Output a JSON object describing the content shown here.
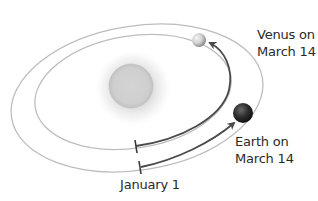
{
  "diagram": {
    "title": "",
    "labels": {
      "venus": {
        "line1": "Venus on",
        "line2": "March 14"
      },
      "earth": {
        "line1": "Earth on",
        "line2": "March 14"
      },
      "start": "January 1"
    },
    "bodies": [
      {
        "name": "Sun",
        "color": "#c8c8c8"
      },
      {
        "name": "Venus",
        "color": "#d9d9d9"
      },
      {
        "name": "Earth",
        "color": "#2e2e2e"
      }
    ],
    "orbits": [
      {
        "name": "Venus orbit",
        "color": "#bdbdbd"
      },
      {
        "name": "Earth orbit",
        "color": "#bdbdbd"
      }
    ],
    "arrows": [
      {
        "from": "January 1",
        "to": "Venus on March 14",
        "color": "#4a4a4a"
      },
      {
        "from": "January 1",
        "to": "Earth on March 14",
        "color": "#4a4a4a"
      }
    ]
  }
}
